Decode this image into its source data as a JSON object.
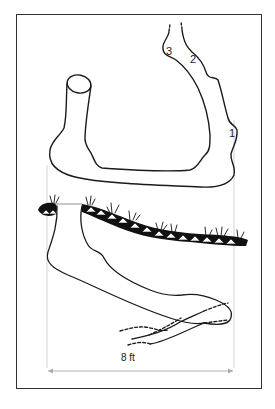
{
  "figure": {
    "title": "",
    "labels": {
      "stage_1": "1",
      "stage_2": "2",
      "stage_3": "3",
      "dimension": "8 ft"
    },
    "colors": {
      "line": "#1a1a1a",
      "frame": "#333333",
      "guide": "#bbbbbb",
      "background": "#ffffff"
    },
    "upper_view": "Burrow tunnel in plan: circular entrance shaft at left, U-shaped tunnel extending right and up, with numbered chambers 1, 2, 3 along the right arm",
    "lower_view": "Burrow in cross-section beneath ground surface with grass tufts; tunnel descends from surface and branches, dashed continuation lines",
    "scale": {
      "label": "8 ft",
      "from_x": 47,
      "to_x": 234
    }
  }
}
